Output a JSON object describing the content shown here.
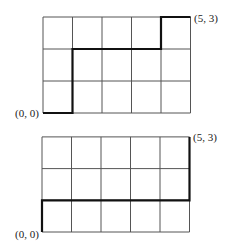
{
  "diagrams": [
    {
      "name": "top-lattice",
      "cols": 5,
      "rows": 3,
      "origin_px": [
        43,
        113
      ],
      "cell_w": 29.5,
      "cell_h": 32,
      "start_label": "(0, 0)",
      "end_label": "(5, 3)",
      "path": [
        [
          0,
          0
        ],
        [
          1,
          0
        ],
        [
          1,
          2
        ],
        [
          4,
          2
        ],
        [
          4,
          3
        ],
        [
          5,
          3
        ]
      ]
    },
    {
      "name": "bottom-lattice",
      "cols": 5,
      "rows": 3,
      "origin_px": [
        42,
        232
      ],
      "cell_w": 29.5,
      "cell_h": 31.7,
      "start_label": "(0, 0)",
      "end_label": "(5, 3)",
      "path": [
        [
          0,
          0
        ],
        [
          0,
          1
        ],
        [
          5,
          1
        ],
        [
          5,
          3
        ]
      ]
    }
  ],
  "colors": {
    "grid": "#555555",
    "path": "#111111",
    "background": "#ffffff"
  }
}
